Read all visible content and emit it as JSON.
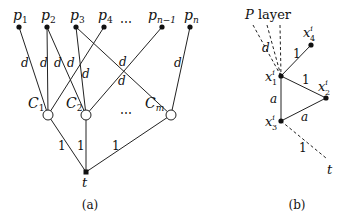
{
  "panel_a": {
    "caption": "(a)",
    "p_nodes": [
      {
        "label": "p",
        "sub": "1",
        "x": 19,
        "y": 27
      },
      {
        "label": "p",
        "sub": "2",
        "x": 47,
        "y": 27
      },
      {
        "label": "p",
        "sub": "3",
        "x": 76,
        "y": 27
      },
      {
        "label": "p",
        "sub": "4",
        "x": 104,
        "y": 27
      },
      {
        "label": "p",
        "sub": "n−1",
        "x": 162,
        "y": 27
      },
      {
        "label": "p",
        "sub": "n",
        "x": 190,
        "y": 27
      }
    ],
    "p_ellipsis": "⋯",
    "c_nodes": [
      {
        "label": "C",
        "sub": "1",
        "x": 48,
        "y": 115
      },
      {
        "label": "C",
        "sub": "2",
        "x": 86,
        "y": 115
      },
      {
        "label": "C",
        "sub": "m",
        "x": 171,
        "y": 115
      }
    ],
    "c_ellipsis": "⋯",
    "sink": {
      "label": "t",
      "x": 86,
      "y": 172
    },
    "edge_weight_d": "d",
    "edge_weight_1": "1",
    "d_labels": [
      {
        "x": 24,
        "y": 67
      },
      {
        "x": 42,
        "y": 67
      },
      {
        "x": 57,
        "y": 67
      },
      {
        "x": 70,
        "y": 67
      },
      {
        "x": 85,
        "y": 78
      },
      {
        "x": 122,
        "y": 67
      },
      {
        "x": 121,
        "y": 84
      },
      {
        "x": 178,
        "y": 67
      }
    ],
    "one_labels": [
      {
        "x": 60,
        "y": 149
      },
      {
        "x": 79,
        "y": 149
      },
      {
        "x": 114,
        "y": 149
      }
    ]
  },
  "panel_b": {
    "caption": "(b)",
    "layer_label": "P layer",
    "layer_label_italic": "P",
    "layer_label_rest": " layer",
    "nodes": [
      {
        "label": "x",
        "sub": "1",
        "sup": "i",
        "x": 281,
        "y": 76
      },
      {
        "label": "x",
        "sub": "2",
        "sup": "i",
        "x": 326,
        "y": 98
      },
      {
        "label": "x",
        "sub": "3",
        "sup": "i",
        "x": 281,
        "y": 121
      },
      {
        "label": "x",
        "sub": "4",
        "sup": "i",
        "x": 311,
        "y": 45
      }
    ],
    "sink": {
      "label": "t"
    },
    "edge_labels": {
      "d": "d",
      "x1_x4": "1",
      "x1_x2": "1",
      "x1_x3": "a",
      "x3_x2": "a",
      "x3_t": "1"
    }
  }
}
